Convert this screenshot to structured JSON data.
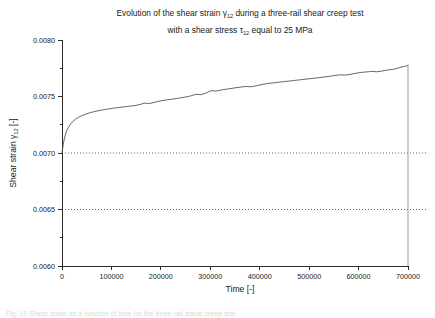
{
  "figure": {
    "title_line1_prefix": "Evolution of the shear strain ",
    "title_line1_symbol": "γ",
    "title_line1_sub": "12",
    "title_line1_suffix": " during a three-rail shear creep test",
    "title_line2_prefix": "with a shear stress ",
    "title_line2_symbol": "τ",
    "title_line2_sub": "12",
    "title_line2_suffix": " equal to 25 MPa",
    "caption_fragment": "Fig. 10  Shear strain as a function of time for the three-rail shear creep test"
  },
  "chart_data": {
    "type": "line",
    "title": "Evolution of the shear strain γ12 during a three-rail shear creep test with a shear stress τ12 equal to 25 MPa",
    "xlabel_prefix": "Time",
    "xlabel_units": "[-]",
    "xlabel": "Time [-]",
    "ylabel_prefix": "Shear strain ",
    "ylabel_symbol": "γ",
    "ylabel_sub": "12",
    "ylabel_units": " [-]",
    "ylabel": "Shear strain γ12 [-]",
    "xlim": [
      0,
      700000
    ],
    "ylim": [
      0.006,
      0.008
    ],
    "xticks": [
      0,
      100000,
      200000,
      300000,
      400000,
      500000,
      600000,
      700000
    ],
    "xtick_labels": [
      "0",
      "100000",
      "200000",
      "300000",
      "400000",
      "500000",
      "600000",
      "700000"
    ],
    "yticks": [
      0.006,
      0.0065,
      0.007,
      0.0075,
      0.008
    ],
    "ytick_labels": [
      "0.0060",
      "0.0065",
      "0.0070",
      "0.0075",
      "0.0080"
    ],
    "y_minor_ticks": [
      0.00625,
      0.00675,
      0.00725,
      0.00775
    ],
    "grid": "horizontal-dotted",
    "gridlines_y": [
      0.0065,
      0.007
    ],
    "legend": "none",
    "line_color": "#4a4a4a",
    "series": [
      {
        "name": "shear strain γ12",
        "x": [
          0,
          1000,
          2500,
          4000,
          6000,
          8500,
          11000,
          14000,
          18000,
          22000,
          27000,
          33000,
          40000,
          48000,
          57000,
          67000,
          78000,
          90000,
          103000,
          117000,
          132000,
          148000,
          160000,
          168000,
          175000,
          182000,
          190000,
          200000,
          212000,
          222000,
          232000,
          240000,
          248000,
          256000,
          262000,
          268000,
          274000,
          280000,
          286000,
          292000,
          298000,
          304000,
          310000,
          316000,
          322000,
          328000,
          334000,
          340000,
          348000,
          356000,
          364000,
          372000,
          380000,
          388000,
          396000,
          404000,
          412000,
          420000,
          428000,
          436000,
          444000,
          452000,
          460000,
          468000,
          476000,
          484000,
          492000,
          500000,
          508000,
          516000,
          524000,
          532000,
          540000,
          548000,
          556000,
          564000,
          572000,
          580000,
          588000,
          596000,
          604000,
          612000,
          620000,
          628000,
          636000,
          644000,
          652000,
          660000,
          668000,
          674000,
          680000,
          686000,
          691000,
          695000,
          698000,
          700000
        ],
        "y": [
          0.007,
          0.00703,
          0.007075,
          0.00711,
          0.00715,
          0.007185,
          0.00721,
          0.007235,
          0.00726,
          0.00728,
          0.007298,
          0.007315,
          0.00733,
          0.007344,
          0.007357,
          0.007368,
          0.007378,
          0.007387,
          0.007396,
          0.007404,
          0.007412,
          0.00742,
          0.007432,
          0.007442,
          0.007437,
          0.007443,
          0.007452,
          0.007462,
          0.00747,
          0.007476,
          0.007482,
          0.007488,
          0.007494,
          0.0075,
          0.007508,
          0.007516,
          0.00752,
          0.007516,
          0.007522,
          0.007532,
          0.007545,
          0.007552,
          0.007548,
          0.007552,
          0.007558,
          0.007562,
          0.007566,
          0.00757,
          0.007575,
          0.00758,
          0.007585,
          0.007589,
          0.007586,
          0.00759,
          0.007598,
          0.007606,
          0.007612,
          0.007617,
          0.007621,
          0.007625,
          0.007629,
          0.007633,
          0.007637,
          0.007641,
          0.007645,
          0.007649,
          0.007653,
          0.007657,
          0.007661,
          0.007665,
          0.007669,
          0.007673,
          0.007678,
          0.007683,
          0.007688,
          0.007692,
          0.007689,
          0.007693,
          0.0077,
          0.007707,
          0.007712,
          0.007716,
          0.007719,
          0.007722,
          0.007719,
          0.007723,
          0.007729,
          0.007735,
          0.00774,
          0.007744,
          0.007752,
          0.00776,
          0.007764,
          0.007768,
          0.007774,
          0.007778
        ]
      }
    ]
  }
}
